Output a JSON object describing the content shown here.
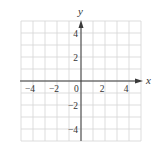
{
  "chart_data": {
    "type": "scatter",
    "title": "",
    "xlabel": "x",
    "ylabel": "y",
    "xlim": [
      -5,
      5
    ],
    "ylim": [
      -5,
      5
    ],
    "grid": true,
    "grid_step": 1,
    "x_ticks": [
      -4,
      -2,
      0,
      2,
      4
    ],
    "x_tick_labels": [
      "−4",
      "−2",
      "0",
      "2",
      "4"
    ],
    "y_ticks": [
      4,
      2,
      -2,
      -4
    ],
    "y_tick_labels": [
      "4",
      "2",
      "−2",
      "−4"
    ],
    "series": [],
    "legend": null
  },
  "colors": {
    "grid": "#d4d4d4",
    "axis": "#3a3a3a",
    "text": "#333333",
    "background": "#ffffff"
  }
}
